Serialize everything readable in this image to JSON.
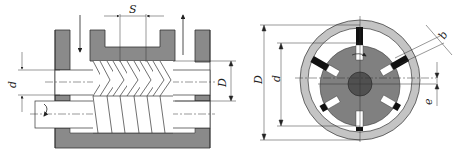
{
  "figure": {
    "left": {
      "title": "screw-type pump cross-section",
      "labels": {
        "pitch": "S",
        "inner_diameter": "d",
        "outer_diameter": "D"
      }
    },
    "right": {
      "title": "vane pump cross-section",
      "labels": {
        "outer_diameter": "D",
        "inner_diameter": "d",
        "vane_thickness": "b",
        "eccentricity": "e"
      },
      "vane_count": 6
    },
    "colors": {
      "housing": "#8a8a8a",
      "ring": "#c4c4c4",
      "rotor": "#808080",
      "hub": "#505050",
      "vane": "#111111",
      "line": "#333333"
    }
  }
}
